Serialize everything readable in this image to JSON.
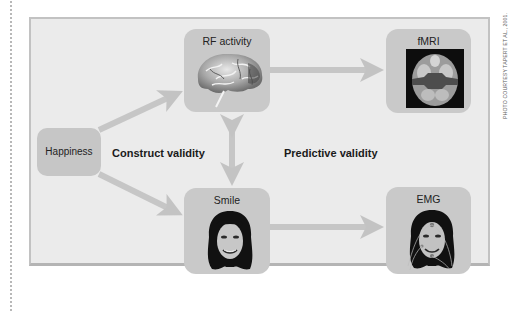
{
  "figure": {
    "credit": "PHOTO COURTESY TAPERT ET AL., 2001.",
    "nodes": {
      "happiness": "Happiness",
      "rf_activity": "RF activity",
      "fmri": "fMRI",
      "smile": "Smile",
      "emg": "EMG"
    },
    "edge_labels": {
      "construct": "Construct validity",
      "predictive": "Predictive validity"
    },
    "edges": [
      {
        "from": "Happiness",
        "to": "RF activity",
        "direction": "forward"
      },
      {
        "from": "Happiness",
        "to": "Smile",
        "direction": "forward"
      },
      {
        "from": "RF activity",
        "to": "Smile",
        "direction": "bidirectional"
      },
      {
        "from": "RF activity",
        "to": "fMRI",
        "direction": "forward"
      },
      {
        "from": "Smile",
        "to": "EMG",
        "direction": "forward"
      }
    ],
    "images": {
      "rf_activity": "brain-illustration",
      "fmri": "fmri-brain-scan",
      "smile": "smiling-face-photo",
      "emg": "face-with-emg-electrodes"
    },
    "colors": {
      "panel": "#ebebeb",
      "box": "#c9c9c9",
      "arrow": "#c3c3c3",
      "text": "#222222"
    }
  }
}
